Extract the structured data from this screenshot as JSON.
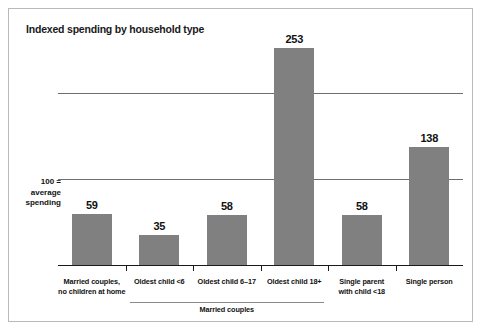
{
  "chart_data": {
    "type": "bar",
    "title": "Indexed spending by household type",
    "xlabel": "",
    "ylabel": "",
    "ylim": [
      0,
      260
    ],
    "grid": true,
    "gridlines": [
      100,
      200
    ],
    "legend": "none",
    "axis_note_lines": [
      "100 =",
      "average",
      "spending"
    ],
    "categories": [
      "Married couples,\nno children at home",
      "Oldest child <6",
      "Oldest child 6–17",
      "Oldest child 18+",
      "Single parent\nwith child <18",
      "Single person"
    ],
    "category_labels": [
      {
        "line1": "Married couples,",
        "line2": "no children at home"
      },
      {
        "line1": "Oldest child <6",
        "line2": ""
      },
      {
        "line1": "Oldest child 6–17",
        "line2": ""
      },
      {
        "line1": "Oldest child 18+",
        "line2": ""
      },
      {
        "line1": "Single parent",
        "line2": "with child <18"
      },
      {
        "line1": "Single person",
        "line2": ""
      }
    ],
    "values": [
      59,
      35,
      58,
      253,
      58,
      138
    ],
    "value_labels": [
      "59",
      "35",
      "58",
      "253",
      "58",
      "138"
    ],
    "group_bracket": {
      "label": "Married couples",
      "covers_categories": [
        1,
        2,
        3
      ]
    },
    "colors": {
      "bar": "#808080",
      "axis": "#1a1a1a",
      "gridline": "#6e6e6e",
      "text": "#111111",
      "frame": "#b9b9b9",
      "background": "#ffffff"
    }
  }
}
